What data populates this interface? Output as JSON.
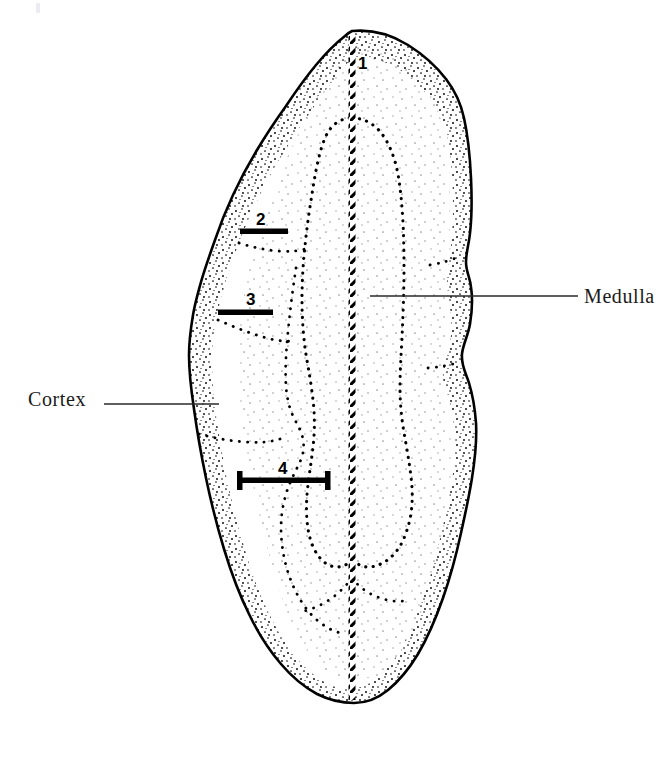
{
  "figure": {
    "type": "anatomical-line-drawing",
    "background_color": "#ffffff",
    "ink_color": "#000000",
    "text_color": "#1a1a1a"
  },
  "labels": {
    "medulla": "Medulla",
    "cortex": "Cortex"
  },
  "callouts": [
    {
      "id": "1",
      "label": "1",
      "kind": "center-line-marker"
    },
    {
      "id": "2",
      "label": "2",
      "kind": "measurement-bar"
    },
    {
      "id": "3",
      "label": "3",
      "kind": "measurement-bar"
    },
    {
      "id": "4",
      "label": "4",
      "kind": "measurement-bar-capped"
    }
  ],
  "leaders": {
    "medulla_line": "horizontal leader from medulla boundary to label",
    "cortex_line": "horizontal leader from label to cortex band"
  },
  "artifacts": {
    "corner_mark": "faint scan artifact, top-left"
  }
}
